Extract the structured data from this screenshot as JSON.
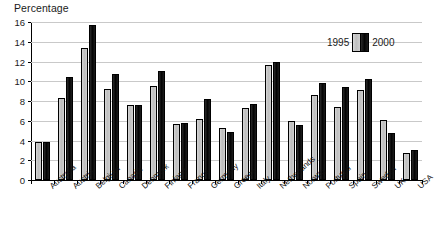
{
  "chart_data": {
    "type": "bar",
    "title": "Percentage",
    "xlabel": "",
    "ylabel": "Percentage",
    "ylim": [
      0,
      16
    ],
    "ytick_step": 2,
    "yticks": [
      0,
      2,
      4,
      6,
      8,
      10,
      12,
      14,
      16
    ],
    "grid": true,
    "legend_position": "top-right",
    "categories": [
      "Australia",
      "Austria",
      "Belgium",
      "Canada",
      "Denmark",
      "Finland",
      "France",
      "Germany",
      "Greece",
      "Italy",
      "Netherlands",
      "Norway",
      "Portugal",
      "Spain",
      "Sweden",
      "UK",
      "USA"
    ],
    "series": [
      {
        "name": "1995",
        "color": "#c4c4c4",
        "values": [
          3.8,
          8.3,
          13.4,
          9.2,
          7.6,
          9.5,
          5.65,
          6.15,
          5.3,
          7.3,
          11.6,
          6.0,
          8.6,
          7.4,
          9.1,
          6.1,
          2.75
        ]
      },
      {
        "name": "2000",
        "color": "#111111",
        "values": [
          3.9,
          10.4,
          15.7,
          10.7,
          7.55,
          11.0,
          5.8,
          8.25,
          4.85,
          7.7,
          12.0,
          5.6,
          9.8,
          9.4,
          10.2,
          4.8,
          3.0
        ]
      }
    ]
  },
  "legend": {
    "left_label": "1995",
    "right_label": "2000"
  }
}
